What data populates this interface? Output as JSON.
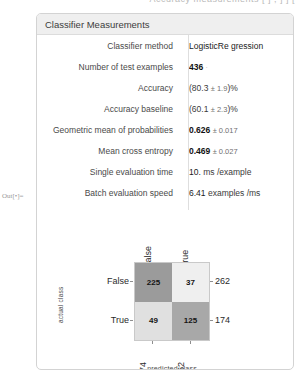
{
  "top_clip": "Accuracy measurements [ ] , ] ] [",
  "out_prompt": "Out[•]=",
  "card": {
    "title": "Classifier Measurements"
  },
  "measurements": [
    {
      "label": "Classifier method",
      "value": "LogisticRe gression",
      "bold": false,
      "error": "",
      "suffix": ""
    },
    {
      "label": "Number of test examples",
      "value": "436",
      "bold": true,
      "error": "",
      "suffix": ""
    },
    {
      "label": "Accuracy",
      "value": "(80.3",
      "bold": false,
      "error": "± 1.9",
      "suffix": ")%"
    },
    {
      "label": "Accuracy baseline",
      "value": "(60.1",
      "bold": false,
      "error": "± 2.3",
      "suffix": ")%"
    },
    {
      "label": "Geometric mean of probabilities",
      "value": "0.626",
      "bold": true,
      "error": "± 0.017",
      "suffix": ""
    },
    {
      "label": "Mean cross entropy",
      "value": "0.469",
      "bold": true,
      "error": "± 0.027",
      "suffix": ""
    },
    {
      "label": "Single evaluation time",
      "value": "10.",
      "bold": false,
      "error": "",
      "suffix": "ms /example"
    },
    {
      "label": "Batch evaluation speed",
      "value": "6.41",
      "bold": false,
      "error": "",
      "suffix": "examples /ms"
    }
  ],
  "chart_data": {
    "type": "heatmap",
    "title": "",
    "xlabel": "predicted class",
    "ylabel": "actual class",
    "categories_x": [
      "False",
      "True"
    ],
    "categories_y": [
      "False",
      "True"
    ],
    "matrix": [
      [
        225,
        37
      ],
      [
        49,
        125
      ]
    ],
    "row_totals": [
      262,
      174
    ],
    "col_totals": [
      274,
      162
    ],
    "cell_colors": [
      "#9b9b9b",
      "#efefef",
      "#e0e0e0",
      "#a8a8a8"
    ],
    "grid": false,
    "legend": "none"
  }
}
